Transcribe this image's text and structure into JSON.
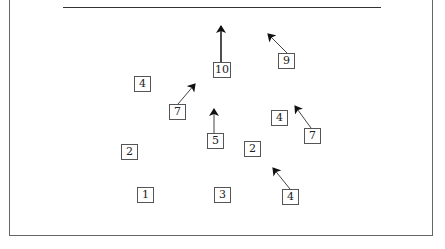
{
  "diagram": {
    "colors": {
      "line": "#333333",
      "box_border": "#555555",
      "text": "#222222",
      "background": "#ffffff"
    },
    "nodes": [
      {
        "id": "n10",
        "label": "10",
        "x": 213,
        "y": 62,
        "arrow": {
          "from": [
            221,
            62
          ],
          "to": [
            221,
            26
          ]
        }
      },
      {
        "id": "n9",
        "label": "9",
        "x": 278,
        "y": 53,
        "arrow": {
          "from": [
            287,
            53
          ],
          "to": [
            268,
            34
          ]
        }
      },
      {
        "id": "n4a",
        "label": "4",
        "x": 134,
        "y": 76,
        "arrow": null
      },
      {
        "id": "n7a",
        "label": "7",
        "x": 169,
        "y": 104,
        "arrow": {
          "from": [
            178,
            104
          ],
          "to": [
            195,
            84
          ]
        }
      },
      {
        "id": "n5",
        "label": "5",
        "x": 207,
        "y": 133,
        "arrow": {
          "from": [
            214,
            133
          ],
          "to": [
            214,
            109
          ]
        }
      },
      {
        "id": "n4b",
        "label": "4",
        "x": 271,
        "y": 110,
        "arrow": null
      },
      {
        "id": "n7b",
        "label": "7",
        "x": 304,
        "y": 128,
        "arrow": {
          "from": [
            311,
            128
          ],
          "to": [
            295,
            106
          ]
        }
      },
      {
        "id": "n2a",
        "label": "2",
        "x": 121,
        "y": 144,
        "arrow": null
      },
      {
        "id": "n2b",
        "label": "2",
        "x": 244,
        "y": 141,
        "arrow": null
      },
      {
        "id": "n1",
        "label": "1",
        "x": 137,
        "y": 187,
        "arrow": null
      },
      {
        "id": "n3",
        "label": "3",
        "x": 214,
        "y": 187,
        "arrow": null
      },
      {
        "id": "n4c",
        "label": "4",
        "x": 282,
        "y": 189,
        "arrow": {
          "from": [
            290,
            189
          ],
          "to": [
            273,
            168
          ]
        }
      }
    ]
  }
}
